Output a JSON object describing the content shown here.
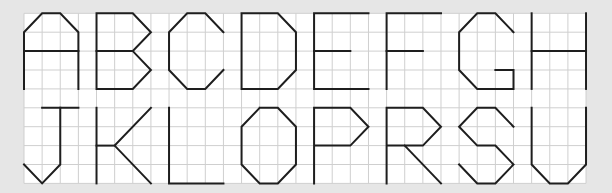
{
  "grid": {
    "origin_x": 24,
    "origin_y": 13.3,
    "cell_w": 18.13,
    "cell_h": 18.9,
    "cols": 31,
    "rows": 9,
    "background": "#ffffff",
    "line_color": "#cfcfcf",
    "page_background": "#e6e6e6"
  },
  "stroke_color": "#1e1e1e",
  "letters": [
    {
      "char": "A",
      "col": 0,
      "row": 0,
      "paths": [
        [
          [
            0,
            4
          ],
          [
            0,
            1
          ],
          [
            1,
            0
          ],
          [
            2,
            0
          ],
          [
            3,
            1
          ],
          [
            3,
            4
          ]
        ],
        [
          [
            0,
            2
          ],
          [
            3,
            2
          ]
        ]
      ]
    },
    {
      "char": "B",
      "col": 4,
      "row": 0,
      "paths": [
        [
          [
            0,
            0
          ],
          [
            2,
            0
          ],
          [
            3,
            1
          ],
          [
            2,
            2
          ],
          [
            3,
            3
          ],
          [
            2,
            4
          ],
          [
            0,
            4
          ],
          [
            0,
            0
          ]
        ],
        [
          [
            0,
            2
          ],
          [
            2,
            2
          ]
        ]
      ]
    },
    {
      "char": "C",
      "col": 8,
      "row": 0,
      "paths": [
        [
          [
            3,
            1
          ],
          [
            2,
            0
          ],
          [
            1,
            0
          ],
          [
            0,
            1
          ],
          [
            0,
            3
          ],
          [
            1,
            4
          ],
          [
            2,
            4
          ],
          [
            3,
            3
          ]
        ]
      ]
    },
    {
      "char": "D",
      "col": 12,
      "row": 0,
      "paths": [
        [
          [
            0,
            0
          ],
          [
            2,
            0
          ],
          [
            3,
            1
          ],
          [
            3,
            3
          ],
          [
            2,
            4
          ],
          [
            0,
            4
          ],
          [
            0,
            0
          ]
        ]
      ]
    },
    {
      "char": "E",
      "col": 16,
      "row": 0,
      "paths": [
        [
          [
            3,
            0
          ],
          [
            0,
            0
          ],
          [
            0,
            4
          ],
          [
            3,
            4
          ]
        ],
        [
          [
            0,
            2
          ],
          [
            2,
            2
          ]
        ]
      ]
    },
    {
      "char": "F",
      "col": 20,
      "row": 0,
      "paths": [
        [
          [
            3,
            0
          ],
          [
            0,
            0
          ],
          [
            0,
            4
          ]
        ],
        [
          [
            0,
            2
          ],
          [
            2,
            2
          ]
        ]
      ]
    },
    {
      "char": "G",
      "col": 24,
      "row": 0,
      "paths": [
        [
          [
            3,
            1
          ],
          [
            2,
            0
          ],
          [
            1,
            0
          ],
          [
            0,
            1
          ],
          [
            0,
            3
          ],
          [
            1,
            4
          ],
          [
            3,
            4
          ],
          [
            3,
            3
          ],
          [
            2,
            3
          ]
        ]
      ]
    },
    {
      "char": "H",
      "col": 28,
      "row": 0,
      "paths": [
        [
          [
            0,
            0
          ],
          [
            0,
            4
          ]
        ],
        [
          [
            3,
            0
          ],
          [
            3,
            4
          ]
        ],
        [
          [
            0,
            2
          ],
          [
            3,
            2
          ]
        ]
      ]
    },
    {
      "char": "J",
      "col": 0,
      "row": 5,
      "paths": [
        [
          [
            1,
            0
          ],
          [
            3,
            0
          ]
        ],
        [
          [
            2,
            0
          ],
          [
            2,
            3
          ],
          [
            1,
            4
          ],
          [
            0,
            3
          ]
        ]
      ]
    },
    {
      "char": "K",
      "col": 4,
      "row": 5,
      "paths": [
        [
          [
            0,
            0
          ],
          [
            0,
            4
          ]
        ],
        [
          [
            0,
            2
          ],
          [
            1,
            2
          ]
        ],
        [
          [
            3,
            0
          ],
          [
            1,
            2
          ],
          [
            3,
            4
          ]
        ]
      ]
    },
    {
      "char": "L",
      "col": 8,
      "row": 5,
      "paths": [
        [
          [
            0,
            0
          ],
          [
            0,
            4
          ],
          [
            3,
            4
          ]
        ]
      ]
    },
    {
      "char": "O",
      "col": 12,
      "row": 5,
      "paths": [
        [
          [
            1,
            0
          ],
          [
            2,
            0
          ],
          [
            3,
            1
          ],
          [
            3,
            3
          ],
          [
            2,
            4
          ],
          [
            1,
            4
          ],
          [
            0,
            3
          ],
          [
            0,
            1
          ],
          [
            1,
            0
          ]
        ]
      ]
    },
    {
      "char": "P",
      "col": 16,
      "row": 5,
      "paths": [
        [
          [
            0,
            4
          ],
          [
            0,
            0
          ],
          [
            2,
            0
          ],
          [
            3,
            1
          ],
          [
            2,
            2
          ],
          [
            0,
            2
          ]
        ]
      ]
    },
    {
      "char": "R",
      "col": 20,
      "row": 5,
      "paths": [
        [
          [
            0,
            4
          ],
          [
            0,
            0
          ],
          [
            2,
            0
          ],
          [
            3,
            1
          ],
          [
            2,
            2
          ],
          [
            0,
            2
          ]
        ],
        [
          [
            1,
            2
          ],
          [
            3,
            4
          ]
        ]
      ]
    },
    {
      "char": "S",
      "col": 24,
      "row": 5,
      "paths": [
        [
          [
            3,
            1
          ],
          [
            2,
            0
          ],
          [
            1,
            0
          ],
          [
            0,
            1
          ],
          [
            1,
            2
          ],
          [
            2,
            2
          ],
          [
            3,
            3
          ],
          [
            2,
            4
          ],
          [
            1,
            4
          ],
          [
            0,
            3
          ]
        ]
      ]
    },
    {
      "char": "U",
      "col": 28,
      "row": 5,
      "paths": [
        [
          [
            0,
            0
          ],
          [
            0,
            3
          ],
          [
            1,
            4
          ],
          [
            2,
            4
          ],
          [
            3,
            3
          ],
          [
            3,
            0
          ]
        ]
      ]
    }
  ]
}
